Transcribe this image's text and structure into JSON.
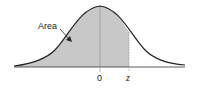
{
  "diagram": {
    "type": "normal-distribution",
    "annotation": "Area",
    "x_labels": {
      "mean": "0",
      "z": "z"
    },
    "colors": {
      "curve": "#222222",
      "shade": "#c8c8c8",
      "axis": "#333333",
      "mean_line": "#888888"
    }
  }
}
